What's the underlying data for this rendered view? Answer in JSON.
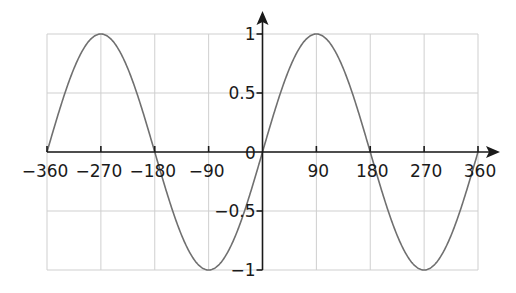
{
  "chart_data": {
    "type": "line",
    "title": "",
    "xlabel": "",
    "ylabel": "",
    "function": "y = sin(x)",
    "x_unit": "degrees",
    "xlim": [
      -360,
      360
    ],
    "ylim": [
      -1,
      1
    ],
    "grid": true,
    "x_ticks": [
      -360,
      -270,
      -180,
      -90,
      0,
      90,
      180,
      270,
      360
    ],
    "x_tick_labels": [
      "−360",
      "−270",
      "−180",
      "−90",
      "0",
      "90",
      "180",
      "270",
      "360"
    ],
    "y_ticks": [
      1,
      0.5,
      -0.5,
      -1
    ],
    "y_tick_labels": [
      "1",
      "0.5",
      "−0.5",
      "−1"
    ],
    "series": [
      {
        "name": "sin x",
        "color": "#707070",
        "x": [
          -360,
          -315,
          -270,
          -225,
          -180,
          -135,
          -90,
          -45,
          0,
          45,
          90,
          135,
          180,
          225,
          270,
          315,
          360
        ],
        "y": [
          0,
          0.707,
          1,
          0.707,
          0,
          -0.707,
          -1,
          -0.707,
          0,
          0.707,
          1,
          0.707,
          0,
          -0.707,
          -1,
          -0.707,
          0
        ]
      }
    ]
  }
}
